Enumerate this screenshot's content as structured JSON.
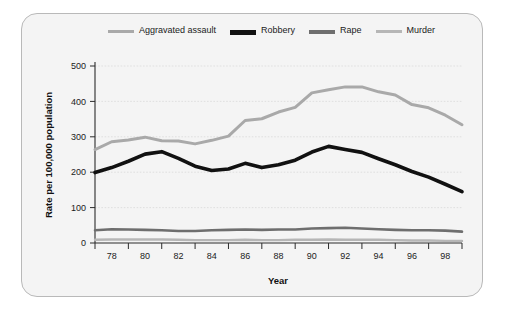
{
  "chart_data": {
    "type": "line",
    "title": "",
    "xlabel": "Year",
    "ylabel": "Rate per 100,000 population",
    "xlim": [
      77,
      99
    ],
    "ylim": [
      0,
      500
    ],
    "yticks": [
      0,
      100,
      200,
      300,
      400,
      500
    ],
    "ytick_labels": [
      "0",
      "100",
      "200",
      "300",
      "400",
      "500"
    ],
    "x": [
      77,
      78,
      79,
      80,
      81,
      82,
      83,
      84,
      85,
      86,
      87,
      88,
      89,
      90,
      91,
      92,
      93,
      94,
      95,
      96,
      97,
      98,
      99
    ],
    "xtick_labels": [
      "78",
      "80",
      "82",
      "84",
      "86",
      "88",
      "90",
      "92",
      "94",
      "96",
      "98"
    ],
    "xtick_values": [
      78,
      80,
      82,
      84,
      86,
      88,
      90,
      92,
      94,
      96,
      98
    ],
    "grid": true,
    "legend_position": "top",
    "series": [
      {
        "name": "Aggravated assault",
        "color": "#a9a9a9",
        "width": 3,
        "values": [
          264,
          286,
          291,
          299,
          289,
          288,
          280,
          290,
          302,
          346,
          351,
          370,
          383,
          424,
          433,
          441,
          441,
          427,
          418,
          391,
          382,
          361,
          334
        ]
      },
      {
        "name": "Robbery",
        "color": "#111111",
        "width": 3.6,
        "values": [
          199,
          213,
          231,
          251,
          258,
          239,
          217,
          205,
          209,
          225,
          213,
          221,
          234,
          257,
          273,
          264,
          256,
          238,
          221,
          202,
          186,
          166,
          145
        ]
      },
      {
        "name": "Rape",
        "color": "#6e6e6e",
        "width": 2.6,
        "values": [
          36,
          39,
          38,
          37,
          36,
          34,
          34,
          36,
          37,
          38,
          37,
          38,
          38,
          41,
          42,
          43,
          41,
          39,
          37,
          36,
          36,
          35,
          32
        ]
      },
      {
        "name": "Murder",
        "color": "#b6b6b6",
        "width": 2.4,
        "values": [
          9,
          10,
          10,
          10,
          10,
          9,
          8,
          8,
          8,
          9,
          8,
          8,
          9,
          9,
          10,
          9,
          9,
          9,
          8,
          7,
          7,
          6,
          6
        ]
      }
    ]
  },
  "legend": {
    "items": [
      {
        "label": "Aggravated assault",
        "swatch": "aggravated-line-swatch"
      },
      {
        "label": "Robbery",
        "swatch": "robbery-line-swatch"
      },
      {
        "label": "Rape",
        "swatch": "rape-line-swatch"
      },
      {
        "label": "Murder",
        "swatch": "murder-line-swatch"
      }
    ]
  },
  "axes": {
    "x_title": "Year",
    "y_title": "Rate per 100,000 population"
  }
}
